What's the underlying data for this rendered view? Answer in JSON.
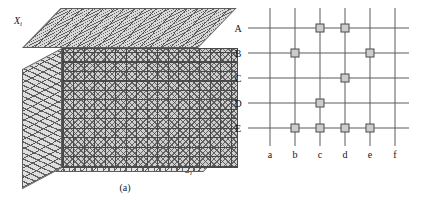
{
  "figure": {
    "panel_a": {
      "caption": "(a)",
      "axis_label_vertical": "X",
      "axis_label_vertical_sub": "i",
      "axis_label_depth": "S",
      "axis_label_depth_sub": "i",
      "shape": "isometric-hatched-block",
      "faces": [
        "top",
        "left",
        "front",
        "bottom"
      ],
      "fill_color": "#cfcfcf",
      "line_color": "#5a5a5a"
    },
    "panel_b": {
      "caption": "(b)",
      "row_labels": [
        "A",
        "B",
        "C",
        "D",
        "E"
      ],
      "col_labels": [
        "a",
        "b",
        "c",
        "d",
        "e",
        "f"
      ],
      "node_color": "#cccccc",
      "line_color": "#5a5a5a",
      "nodes": [
        {
          "row": "A",
          "col": "c"
        },
        {
          "row": "A",
          "col": "d"
        },
        {
          "row": "B",
          "col": "b"
        },
        {
          "row": "B",
          "col": "e"
        },
        {
          "row": "C",
          "col": "d"
        },
        {
          "row": "D",
          "col": "c"
        },
        {
          "row": "E",
          "col": "b"
        },
        {
          "row": "E",
          "col": "c"
        },
        {
          "row": "E",
          "col": "d"
        },
        {
          "row": "E",
          "col": "e"
        }
      ]
    }
  }
}
